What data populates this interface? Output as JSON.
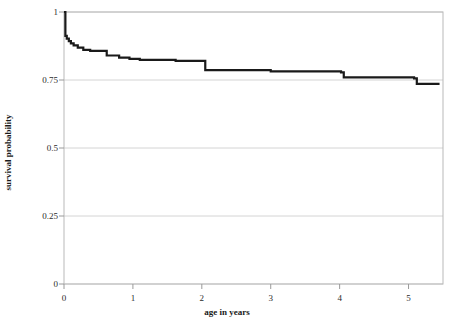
{
  "chart_data": {
    "type": "line",
    "subtype": "kaplan-meier-step",
    "title": "",
    "xlabel": "age in years",
    "ylabel": "survival probability",
    "xlim": [
      0,
      5.5
    ],
    "ylim": [
      0,
      1
    ],
    "xticks": [
      0,
      1,
      2,
      3,
      4,
      5
    ],
    "xtick_labels": [
      "0",
      "1",
      "2",
      "3",
      "4",
      "5"
    ],
    "yticks": [
      0,
      0.25,
      0.5,
      0.75,
      1
    ],
    "ytick_labels": [
      "0",
      "0.25",
      "0.5",
      "0.75",
      "1"
    ],
    "grid": "horizontal",
    "legend": "none",
    "line_color": "#1a1a1a",
    "line_width": 2.2,
    "frame_color": "#b9b9b9",
    "grid_color": "#d4d4d4",
    "series": [
      {
        "name": "survival",
        "x": [
          0.0,
          0.02,
          0.04,
          0.07,
          0.1,
          0.14,
          0.2,
          0.28,
          0.38,
          0.52,
          0.62,
          0.8,
          0.95,
          1.1,
          1.62,
          2.0,
          2.05,
          3.0,
          4.02,
          4.06,
          5.08,
          5.12,
          5.45
        ],
        "y": [
          1.0,
          0.912,
          0.902,
          0.893,
          0.885,
          0.877,
          0.869,
          0.861,
          0.857,
          0.857,
          0.84,
          0.832,
          0.828,
          0.824,
          0.82,
          0.82,
          0.786,
          0.782,
          0.778,
          0.76,
          0.756,
          0.736,
          0.736
        ]
      }
    ]
  },
  "axes": {
    "x_tick_values": [
      "0",
      "1",
      "2",
      "3",
      "4",
      "5"
    ],
    "y_tick_values": [
      "0",
      "0.25",
      "0.5",
      "0.75",
      "1"
    ],
    "x_axis_title": "age in years",
    "y_axis_title": "survival probability"
  }
}
